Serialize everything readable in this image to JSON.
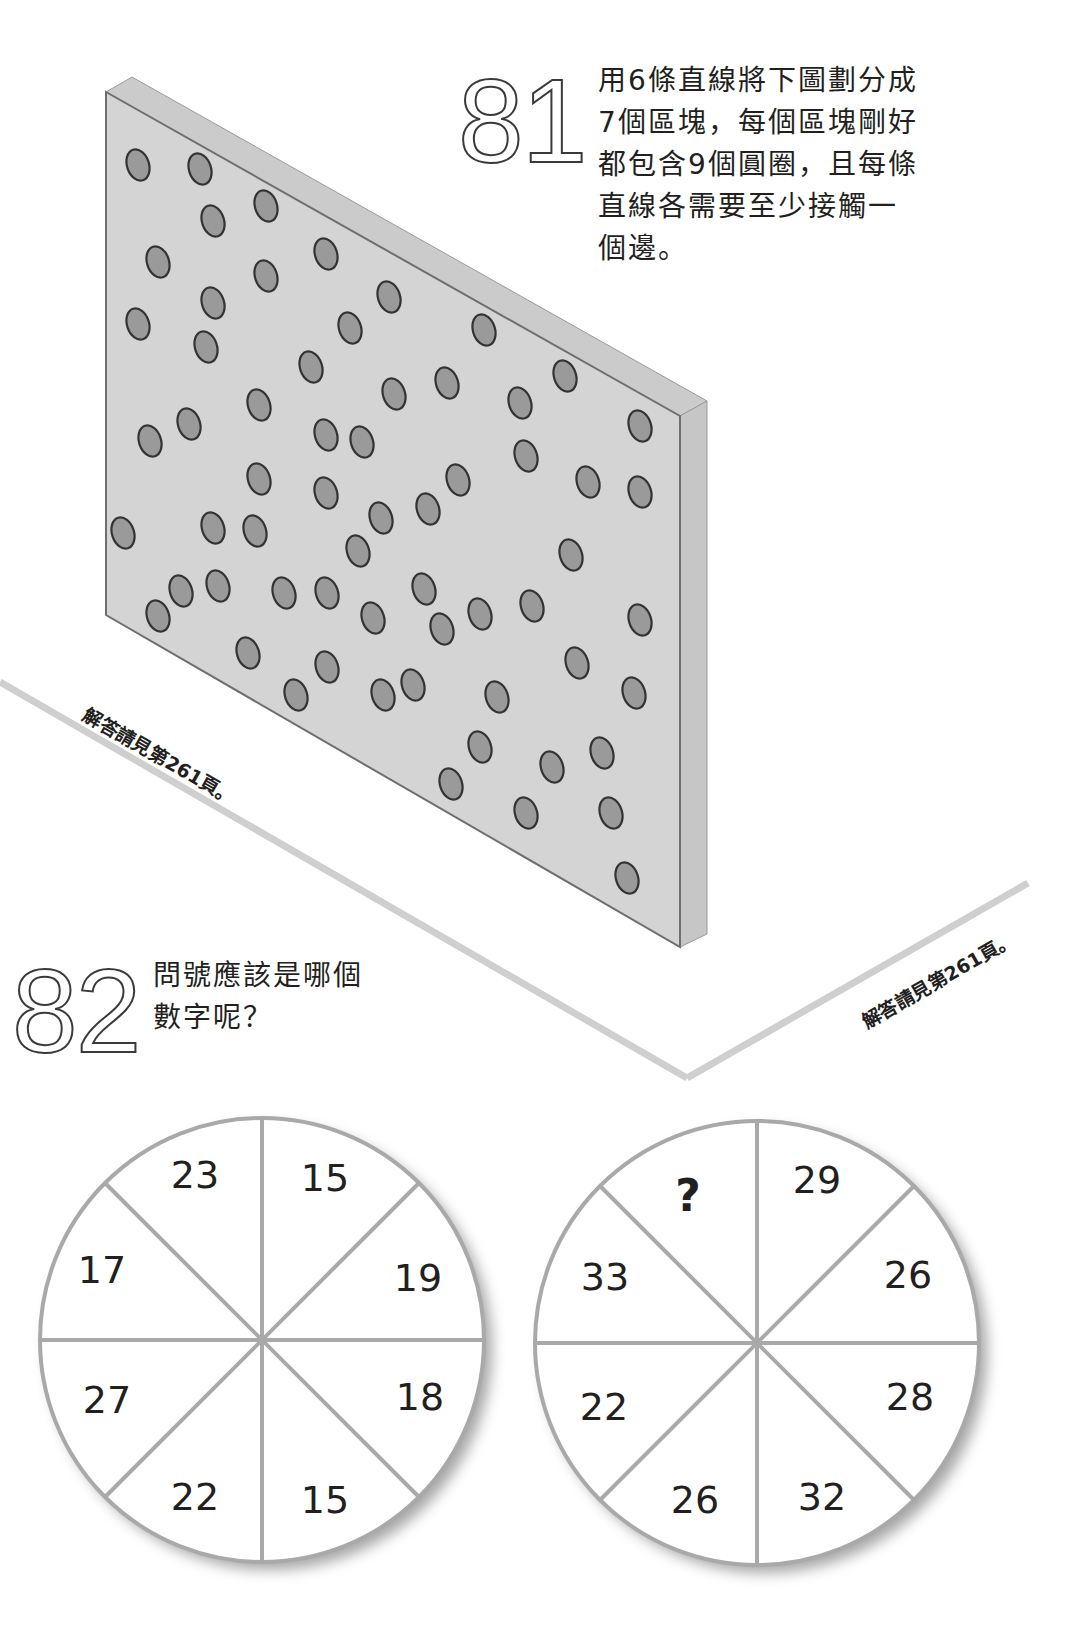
{
  "puzzle81": {
    "number": "81",
    "lines": [
      "用6條直線將下圖劃分成",
      "7個區塊，每個區塊剛好",
      "都包含9個圓圈，且每條",
      "直線各需要至少接觸一",
      "個邊。"
    ],
    "answer_note": "解答請見第261頁。",
    "board": {
      "face_color": "#d4d4d4",
      "top_color": "#cbcbcb",
      "side_color": "#c6c6c6",
      "edge_color": "#6e6e6e",
      "dot_fill": "#9a9a9a",
      "dot_stroke": "#333333",
      "dots": [
        [
          138,
          165
        ],
        [
          200,
          169
        ],
        [
          266,
          206
        ],
        [
          213,
          221
        ],
        [
          158,
          262
        ],
        [
          326,
          254
        ],
        [
          266,
          276
        ],
        [
          389,
          297
        ],
        [
          213,
          303
        ],
        [
          138,
          324
        ],
        [
          350,
          328
        ],
        [
          206,
          347
        ],
        [
          311,
          367
        ],
        [
          484,
          330
        ],
        [
          565,
          376
        ],
        [
          447,
          383
        ],
        [
          394,
          394
        ],
        [
          520,
          403
        ],
        [
          640,
          426
        ],
        [
          526,
          456
        ],
        [
          458,
          480
        ],
        [
          588,
          482
        ],
        [
          640,
          492
        ],
        [
          428,
          509
        ],
        [
          259,
          405
        ],
        [
          150,
          441
        ],
        [
          189,
          424
        ],
        [
          326,
          435
        ],
        [
          362,
          442
        ],
        [
          259,
          479
        ],
        [
          326,
          493
        ],
        [
          381,
          518
        ],
        [
          123,
          533
        ],
        [
          213,
          528
        ],
        [
          255,
          531
        ],
        [
          358,
          551
        ],
        [
          181,
          591
        ],
        [
          218,
          586
        ],
        [
          284,
          593
        ],
        [
          327,
          593
        ],
        [
          158,
          616
        ],
        [
          373,
          618
        ],
        [
          571,
          555
        ],
        [
          424,
          589
        ],
        [
          480,
          614
        ],
        [
          532,
          606
        ],
        [
          640,
          620
        ],
        [
          442,
          629
        ],
        [
          577,
          663
        ],
        [
          413,
          685
        ],
        [
          497,
          697
        ],
        [
          634,
          693
        ],
        [
          248,
          653
        ],
        [
          327,
          667
        ],
        [
          296,
          695
        ],
        [
          383,
          695
        ],
        [
          480,
          747
        ],
        [
          552,
          767
        ],
        [
          602,
          753
        ],
        [
          451,
          784
        ],
        [
          526,
          813
        ],
        [
          611,
          813
        ],
        [
          627,
          878
        ]
      ]
    }
  },
  "puzzle82": {
    "number": "82",
    "lines": [
      "問號應該是哪個",
      "數字呢？"
    ],
    "answer_note": "解答請見第261頁。",
    "wheels": [
      {
        "name": "left-wheel",
        "cx": 262,
        "cy": 1340,
        "r": 222,
        "segments": [
          {
            "label": "23",
            "x": 195,
            "y": 1175
          },
          {
            "label": "15",
            "x": 325,
            "y": 1178
          },
          {
            "label": "19",
            "x": 418,
            "y": 1278
          },
          {
            "label": "18",
            "x": 420,
            "y": 1397
          },
          {
            "label": "15",
            "x": 325,
            "y": 1500
          },
          {
            "label": "22",
            "x": 195,
            "y": 1497
          },
          {
            "label": "27",
            "x": 107,
            "y": 1400
          },
          {
            "label": "17",
            "x": 102,
            "y": 1270
          }
        ]
      },
      {
        "name": "right-wheel",
        "cx": 757,
        "cy": 1343,
        "r": 222,
        "segments": [
          {
            "label": "?",
            "x": 688,
            "y": 1195,
            "bold": true
          },
          {
            "label": "29",
            "x": 817,
            "y": 1180
          },
          {
            "label": "26",
            "x": 908,
            "y": 1275
          },
          {
            "label": "28",
            "x": 910,
            "y": 1397
          },
          {
            "label": "32",
            "x": 822,
            "y": 1497
          },
          {
            "label": "26",
            "x": 695,
            "y": 1500
          },
          {
            "label": "22",
            "x": 604,
            "y": 1407
          },
          {
            "label": "33",
            "x": 605,
            "y": 1277
          }
        ]
      }
    ]
  },
  "colors": {
    "ground_line": "#cfcfcf",
    "wheel_line": "#a9a9a9",
    "text": "#231f20"
  }
}
